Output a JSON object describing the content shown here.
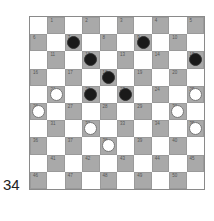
{
  "caption": "34",
  "board": {
    "size": 10,
    "colors": {
      "light": "#ffffff",
      "dark": "#a9a9a9",
      "black_piece": "#1a1a1a",
      "white_piece": "#ffffff"
    },
    "pieces": {
      "black": [
        7,
        9,
        12,
        15,
        18,
        22,
        23
      ],
      "white": [
        21,
        25,
        26,
        30,
        32,
        35,
        38
      ]
    }
  }
}
